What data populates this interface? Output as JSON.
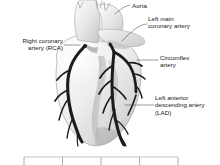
{
  "figure": {
    "style": "grayscale anatomical illustration",
    "background_color": "#ffffff",
    "artery_color": "#1c1c1c",
    "heart_fill_color": "#ededed",
    "heart_shade_color": "#a8a8a8",
    "outline_color": "#8d8d8d",
    "leader_line_color": "#555555"
  },
  "labels": {
    "aorta": "Aorta",
    "left_main_coronary_artery": "Left main\ncoronary artery",
    "right_coronary_artery": "Right coronary\nartery (RCA)",
    "circumflex_artery": "Circumflex\nartery",
    "left_anterior_descending": "Left anterior\ndescending artery\n(LAD)"
  },
  "scale_bar": {
    "visible": true,
    "tick_count": 5,
    "line_color": "#b4b4b4",
    "tick_color": "#9a9a9a"
  }
}
